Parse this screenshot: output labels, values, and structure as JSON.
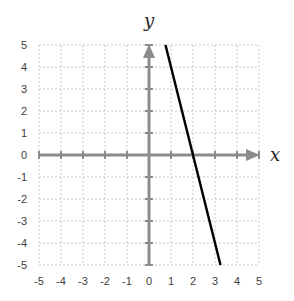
{
  "chart_data": {
    "type": "line",
    "title": "",
    "xlabel": "x",
    "ylabel": "y",
    "xlim": [
      -5,
      5
    ],
    "ylim": [
      -5,
      5
    ],
    "grid": true,
    "x_ticks": [
      -5,
      -4,
      -3,
      -2,
      -1,
      0,
      1,
      2,
      3,
      4,
      5
    ],
    "y_ticks": [
      5,
      4,
      3,
      2,
      1,
      0,
      -1,
      -2,
      -3,
      -4,
      -5
    ],
    "series": [
      {
        "name": "y = -4x + 8",
        "x": [
          0.75,
          3.25
        ],
        "y": [
          5,
          -5
        ],
        "color": "#000000"
      }
    ],
    "colors": {
      "axis": "#8c8c8c",
      "grid": "#c8c8c8",
      "line": "#000000"
    }
  }
}
